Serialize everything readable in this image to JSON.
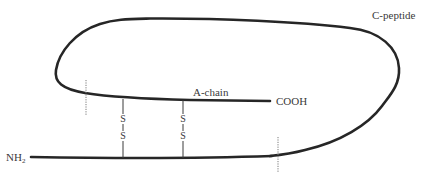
{
  "diagram": {
    "labels": {
      "c_peptide": "C-peptide",
      "a_chain": "A-chain",
      "cooh": "COOH",
      "nh2_main": "NH",
      "nh2_sub": "2"
    },
    "disulfide_bonds": [
      {
        "atom_top": "S",
        "atom_bottom": "S"
      },
      {
        "atom_top": "S",
        "atom_bottom": "S"
      }
    ],
    "colors": {
      "chain_stroke": "#262626",
      "text": "#3a3a3a",
      "cleavage_marker": "#7a7a7a",
      "background": "#ffffff"
    }
  }
}
